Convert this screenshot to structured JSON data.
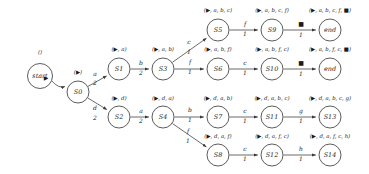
{
  "diagram": {
    "start_annotation": "()",
    "nodes": [
      {
        "id": "start",
        "label": "start",
        "x": 40,
        "y": 76,
        "r": 12.5,
        "annot": "()",
        "annot_x": 40,
        "annot_y": 54
      },
      {
        "id": "S0",
        "label": "S0",
        "x": 78,
        "y": 92,
        "r": 11,
        "annot": "(▶)",
        "annot_x": 78,
        "annot_y": 74
      },
      {
        "id": "S1",
        "label": "S1",
        "x": 119,
        "y": 69,
        "r": 11,
        "annot": "(▶, a)",
        "annot_x": 119,
        "annot_y": 51
      },
      {
        "id": "S2",
        "label": "S2",
        "x": 119,
        "y": 117,
        "r": 11,
        "annot": "(▶, d)",
        "annot_x": 119,
        "annot_y": 100
      },
      {
        "id": "S3",
        "label": "S3",
        "x": 163,
        "y": 69,
        "r": 11,
        "annot": "(▶, a, b)",
        "annot_x": 163,
        "annot_y": 51
      },
      {
        "id": "S4",
        "label": "S4",
        "x": 163,
        "y": 117,
        "r": 11,
        "annot": "(▶, d, a)",
        "annot_x": 163,
        "annot_y": 100
      },
      {
        "id": "S5",
        "label": "S5",
        "x": 218,
        "y": 30,
        "r": 11,
        "annot": "(▶, a, b, c)",
        "annot_x": 218,
        "annot_y": 12
      },
      {
        "id": "S6",
        "label": "S6",
        "x": 218,
        "y": 69,
        "r": 11,
        "annot": "(▶, a, b, f)",
        "annot_x": 218,
        "annot_y": 51
      },
      {
        "id": "S7",
        "label": "S7",
        "x": 218,
        "y": 117,
        "r": 11,
        "annot": "(▶, d, a, b)",
        "annot_x": 218,
        "annot_y": 100
      },
      {
        "id": "S8",
        "label": "S8",
        "x": 218,
        "y": 155,
        "r": 11,
        "annot": "(▶, d, a, f)",
        "annot_x": 218,
        "annot_y": 138
      },
      {
        "id": "S9",
        "label": "S9",
        "x": 272,
        "y": 30,
        "r": 11,
        "annot": "(▶, a, b, c, f)",
        "annot_x": 272,
        "annot_y": 12
      },
      {
        "id": "S10",
        "label": "S10",
        "x": 272,
        "y": 69,
        "r": 11,
        "annot": "(▶, a, b, f, c)",
        "annot_x": 272,
        "annot_y": 51
      },
      {
        "id": "S11",
        "label": "S11",
        "x": 272,
        "y": 117,
        "r": 11,
        "annot": "(▶, d, a, b, c)",
        "annot_x": 272,
        "annot_y": 100
      },
      {
        "id": "S12",
        "label": "S12",
        "x": 272,
        "y": 155,
        "r": 11,
        "annot": "(▶, d, a, f, c)",
        "annot_x": 272,
        "annot_y": 138
      },
      {
        "id": "end1",
        "label": "end",
        "x": 330,
        "y": 30,
        "r": 11,
        "annot": "(▶, a, b, c, f, ■)",
        "annot_x": 330,
        "annot_y": 12
      },
      {
        "id": "end2",
        "label": "end",
        "x": 330,
        "y": 69,
        "r": 11,
        "annot": "(▶, a, b, f, c, ■)",
        "annot_x": 330,
        "annot_y": 51
      },
      {
        "id": "S13",
        "label": "S13",
        "x": 330,
        "y": 117,
        "r": 11,
        "annot": "(▶, d, a, b, c, g)",
        "annot_x": 330,
        "annot_y": 100
      },
      {
        "id": "S14",
        "label": "S14",
        "x": 330,
        "y": 155,
        "r": 11,
        "annot": "(▶, d, a, f, c, h)",
        "annot_x": 330,
        "annot_y": 138
      }
    ],
    "edges": [
      {
        "from": "start",
        "to": "S0",
        "symbol": "▶",
        "weight": "",
        "sym_x": 46,
        "sym_y": 80,
        "w_x": 45,
        "w_y": 89,
        "curved": true
      },
      {
        "from": "S0",
        "to": "S1",
        "symbol": "a",
        "weight": "2",
        "sym_x": 95,
        "sym_y": 76,
        "w_x": 95,
        "w_y": 85
      },
      {
        "from": "S0",
        "to": "S2",
        "symbol": "d",
        "weight": "2",
        "sym_x": 95,
        "sym_y": 110,
        "w_x": 95,
        "w_y": 120
      },
      {
        "from": "S1",
        "to": "S3",
        "symbol": "b",
        "weight": "2",
        "sym_x": 141,
        "sym_y": 65,
        "w_x": 141,
        "w_y": 75
      },
      {
        "from": "S2",
        "to": "S4",
        "symbol": "a",
        "weight": "2",
        "sym_x": 141,
        "sym_y": 113,
        "w_x": 141,
        "w_y": 123
      },
      {
        "from": "S3",
        "to": "S5",
        "symbol": "c",
        "weight": "1",
        "sym_x": 189,
        "sym_y": 44,
        "w_x": 189,
        "w_y": 54
      },
      {
        "from": "S3",
        "to": "S6",
        "symbol": "f",
        "weight": "1",
        "sym_x": 190,
        "sym_y": 64,
        "w_x": 190,
        "w_y": 74
      },
      {
        "from": "S4",
        "to": "S7",
        "symbol": "b",
        "weight": "1",
        "sym_x": 190,
        "sym_y": 112,
        "w_x": 190,
        "w_y": 122
      },
      {
        "from": "S4",
        "to": "S8",
        "symbol": "f",
        "weight": "1",
        "sym_x": 188,
        "sym_y": 133,
        "w_x": 188,
        "w_y": 143
      },
      {
        "from": "S5",
        "to": "S9",
        "symbol": "f",
        "weight": "1",
        "sym_x": 245,
        "sym_y": 26,
        "w_x": 245,
        "w_y": 36
      },
      {
        "from": "S6",
        "to": "S10",
        "symbol": "c",
        "weight": "1",
        "sym_x": 245,
        "sym_y": 65,
        "w_x": 245,
        "w_y": 75
      },
      {
        "from": "S7",
        "to": "S11",
        "symbol": "c",
        "weight": "1",
        "sym_x": 245,
        "sym_y": 113,
        "w_x": 245,
        "w_y": 123
      },
      {
        "from": "S8",
        "to": "S12",
        "symbol": "c",
        "weight": "1",
        "sym_x": 245,
        "sym_y": 151,
        "w_x": 245,
        "w_y": 161
      },
      {
        "from": "S9",
        "to": "end1",
        "symbol": "■",
        "weight": "1",
        "sym_x": 301,
        "sym_y": 26,
        "w_x": 301,
        "w_y": 37
      },
      {
        "from": "S10",
        "to": "end2",
        "symbol": "■",
        "weight": "1",
        "sym_x": 301,
        "sym_y": 65,
        "w_x": 301,
        "w_y": 76
      },
      {
        "from": "S11",
        "to": "S13",
        "symbol": "g",
        "weight": "1",
        "sym_x": 301,
        "sym_y": 113,
        "w_x": 301,
        "w_y": 123
      },
      {
        "from": "S12",
        "to": "S14",
        "symbol": "h",
        "weight": "1",
        "sym_x": 301,
        "sym_y": 151,
        "w_x": 301,
        "w_y": 161
      }
    ]
  }
}
